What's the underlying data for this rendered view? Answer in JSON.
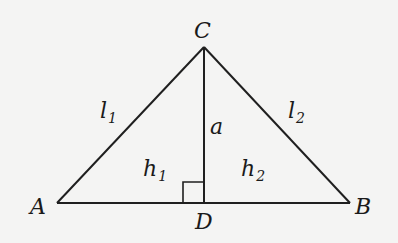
{
  "figure": {
    "stroke_color": "#1f1f1f",
    "background_color": "#f4f4f3",
    "vertices": {
      "A": {
        "label": "A",
        "x": 57,
        "y": 203
      },
      "B": {
        "label": "B",
        "x": 350,
        "y": 203
      },
      "C": {
        "label": "C",
        "x": 204,
        "y": 47
      },
      "D": {
        "label": "D",
        "x": 204,
        "y": 203
      }
    },
    "segments": [
      {
        "from": "A",
        "to": "C",
        "label": "l",
        "subscript": "1"
      },
      {
        "from": "C",
        "to": "B",
        "label": "l",
        "subscript": "2"
      },
      {
        "from": "C",
        "to": "D",
        "label": "a",
        "subscript": ""
      },
      {
        "from": "A",
        "to": "B",
        "label": "",
        "subscript": ""
      }
    ],
    "labels": {
      "vertex_a": "A",
      "vertex_b": "B",
      "vertex_c": "C",
      "vertex_d": "D",
      "side_l1": {
        "base": "l",
        "sub": "1"
      },
      "side_l2": {
        "base": "l",
        "sub": "2"
      },
      "altitude": "a",
      "segment_h1": {
        "base": "h",
        "sub": "1"
      },
      "segment_h2": {
        "base": "h",
        "sub": "2"
      }
    },
    "right_angle_marker": {
      "at": "D",
      "size": 21
    }
  }
}
